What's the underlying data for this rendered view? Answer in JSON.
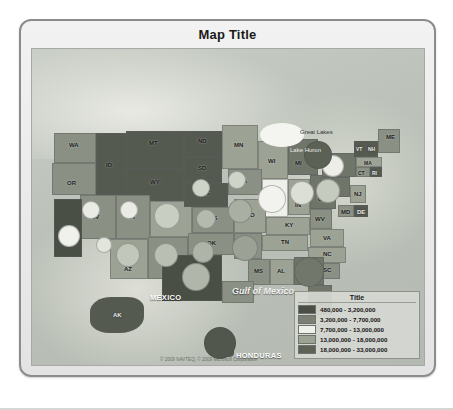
{
  "map": {
    "title": "Map Title",
    "attribution": "© 2009 NAVTEQ, © 2009 Microsoft Corporation",
    "water_labels": [
      {
        "name": "great-lakes",
        "text": "Great Lakes"
      },
      {
        "name": "lake-huron",
        "text": "Lake Huron"
      },
      {
        "name": "gulf-of-mexico",
        "text": "Gulf of Mexico"
      }
    ],
    "country_labels": [
      {
        "name": "mexico",
        "text": "MEXICO"
      },
      {
        "name": "cuba",
        "text": "CUBA"
      },
      {
        "name": "honduras",
        "text": "HONDURAS"
      }
    ],
    "states": [
      {
        "ab": "WA",
        "value_band": 2
      },
      {
        "ab": "OR",
        "value_band": 2
      },
      {
        "ab": "ID",
        "value_band": 1
      },
      {
        "ab": "MT",
        "value_band": 1
      },
      {
        "ab": "ND",
        "value_band": 1
      },
      {
        "ab": "SD",
        "value_band": 1
      },
      {
        "ab": "MN",
        "value_band": 3
      },
      {
        "ab": "WI",
        "value_band": 3
      },
      {
        "ab": "MI",
        "value_band": 4
      },
      {
        "ab": "WY",
        "value_band": 1
      },
      {
        "ab": "NV",
        "value_band": 2
      },
      {
        "ab": "UT",
        "value_band": 2
      },
      {
        "ab": "CO",
        "value_band": 3
      },
      {
        "ab": "NE",
        "value_band": 1
      },
      {
        "ab": "IA",
        "value_band": 2
      },
      {
        "ab": "IL",
        "value_band": 4
      },
      {
        "ab": "IN",
        "value_band": 3
      },
      {
        "ab": "OH",
        "value_band": 4
      },
      {
        "ab": "CA",
        "value_band": 5
      },
      {
        "ab": "AZ",
        "value_band": 3
      },
      {
        "ab": "NM",
        "value_band": 2
      },
      {
        "ab": "KS",
        "value_band": 2
      },
      {
        "ab": "MO",
        "value_band": 3
      },
      {
        "ab": "KY",
        "value_band": 3
      },
      {
        "ab": "WV",
        "value_band": 2
      },
      {
        "ab": "VA",
        "value_band": 3
      },
      {
        "ab": "OK",
        "value_band": 2
      },
      {
        "ab": "AR",
        "value_band": 2
      },
      {
        "ab": "TN",
        "value_band": 3
      },
      {
        "ab": "NC",
        "value_band": 3
      },
      {
        "ab": "TX",
        "value_band": 5
      },
      {
        "ab": "LA",
        "value_band": 2
      },
      {
        "ab": "MS",
        "value_band": 2
      },
      {
        "ab": "AL",
        "value_band": 3
      },
      {
        "ab": "GA",
        "value_band": 4
      },
      {
        "ab": "SC",
        "value_band": 2
      },
      {
        "ab": "FL",
        "value_band": 4
      },
      {
        "ab": "NY",
        "value_band": 4
      },
      {
        "ab": "PA",
        "value_band": 4
      },
      {
        "ab": "NJ",
        "value_band": 3
      },
      {
        "ab": "MD",
        "value_band": 2
      },
      {
        "ab": "DE",
        "value_band": 1
      },
      {
        "ab": "CT",
        "value_band": 2
      },
      {
        "ab": "RI",
        "value_band": 1
      },
      {
        "ab": "MA",
        "value_band": 3
      },
      {
        "ab": "VT",
        "value_band": 1
      },
      {
        "ab": "NH",
        "value_band": 1
      },
      {
        "ab": "ME",
        "value_band": 2
      },
      {
        "ab": "AK",
        "value_band": 1
      },
      {
        "ab": "HI",
        "value_band": 1
      }
    ]
  },
  "legend": {
    "title": "Title",
    "entries": [
      {
        "color": "#4a4f46",
        "label": "480,000 - 3,200,000"
      },
      {
        "color": "#7b8074",
        "label": "3,200,000 - 7,700,000"
      },
      {
        "color": "#eef0ea",
        "label": "7,700,000 - 13,000,000"
      },
      {
        "color": "#9ca294",
        "label": "13,000,000 - 18,000,000"
      },
      {
        "color": "#5d6257",
        "label": "18,000,000 - 33,000,000"
      }
    ]
  }
}
